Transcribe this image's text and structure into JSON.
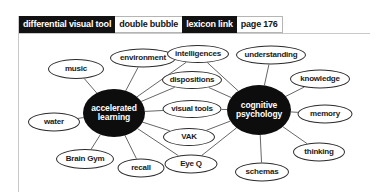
{
  "tabs": [
    {
      "label": "differential visual tool",
      "style": "dark",
      "selected": false
    },
    {
      "label": "double bubble",
      "style": "light",
      "selected": false
    },
    {
      "label": "lexicon link",
      "style": "dark",
      "selected": false
    },
    {
      "label": "page 176",
      "style": "light",
      "selected": true
    }
  ],
  "colors": {
    "hub_fill": "#0d0d0d",
    "hub_text": "#ffffff",
    "leaf_fill": "#ffffff",
    "leaf_stroke": "#2b2b2b",
    "edge_stroke": "#555555",
    "rule": "#c9c9c9",
    "tab_dark_bg": "#121212",
    "tab_dark_text": "#ffffff",
    "tab_light_bg": "#ffffff",
    "tab_light_text": "#151515"
  },
  "diagram": {
    "type": "double-bubble-map",
    "hubs": [
      {
        "id": "accelerated-learning",
        "label": "accelerated learning",
        "x": 114,
        "y": 80,
        "w": 62,
        "h": 48
      },
      {
        "id": "cognitive-psychology",
        "label": "cognitive psychology",
        "x": 259,
        "y": 77,
        "w": 64,
        "h": 50
      }
    ],
    "leaves": [
      {
        "id": "music",
        "label": "music",
        "x": 76,
        "y": 36,
        "w": 56,
        "h": 20,
        "links": [
          "accelerated-learning"
        ]
      },
      {
        "id": "environment",
        "label": "environment",
        "x": 143,
        "y": 25,
        "w": 66,
        "h": 19,
        "links": [
          "accelerated-learning"
        ]
      },
      {
        "id": "water",
        "label": "water",
        "x": 54,
        "y": 89,
        "w": 52,
        "h": 19,
        "links": [
          "accelerated-learning"
        ]
      },
      {
        "id": "brain-gym",
        "label": "Brain Gym",
        "x": 85,
        "y": 126,
        "w": 58,
        "h": 20,
        "links": [
          "accelerated-learning"
        ]
      },
      {
        "id": "recall",
        "label": "recall",
        "x": 141,
        "y": 135,
        "w": 47,
        "h": 19,
        "links": [
          "accelerated-learning"
        ]
      },
      {
        "id": "intelligences",
        "label": "intelligences",
        "x": 198,
        "y": 21,
        "w": 62,
        "h": 18,
        "links": [
          "accelerated-learning",
          "cognitive-psychology"
        ]
      },
      {
        "id": "dispositions",
        "label": "dispositions",
        "x": 192,
        "y": 47,
        "w": 60,
        "h": 18,
        "links": [
          "accelerated-learning",
          "cognitive-psychology"
        ]
      },
      {
        "id": "visual-tools",
        "label": "visual tools",
        "x": 192,
        "y": 76,
        "w": 59,
        "h": 18,
        "links": [
          "accelerated-learning",
          "cognitive-psychology"
        ]
      },
      {
        "id": "vak",
        "label": "VAK",
        "x": 189,
        "y": 104,
        "w": 52,
        "h": 18,
        "links": [
          "accelerated-learning",
          "cognitive-psychology"
        ]
      },
      {
        "id": "eye-q",
        "label": "Eye Q",
        "x": 191,
        "y": 131,
        "w": 53,
        "h": 19,
        "links": [
          "accelerated-learning",
          "cognitive-psychology"
        ]
      },
      {
        "id": "understanding",
        "label": "understanding",
        "x": 271,
        "y": 22,
        "w": 70,
        "h": 19,
        "links": [
          "cognitive-psychology"
        ]
      },
      {
        "id": "knowledge",
        "label": "knowledge",
        "x": 320,
        "y": 46,
        "w": 60,
        "h": 19,
        "links": [
          "cognitive-psychology"
        ]
      },
      {
        "id": "memory",
        "label": "memory",
        "x": 325,
        "y": 81,
        "w": 55,
        "h": 19,
        "links": [
          "cognitive-psychology"
        ]
      },
      {
        "id": "thinking",
        "label": "thinking",
        "x": 319,
        "y": 119,
        "w": 52,
        "h": 19,
        "links": [
          "cognitive-psychology"
        ]
      },
      {
        "id": "schemas",
        "label": "schemas",
        "x": 262,
        "y": 139,
        "w": 54,
        "h": 19,
        "links": [
          "cognitive-psychology"
        ]
      }
    ]
  }
}
